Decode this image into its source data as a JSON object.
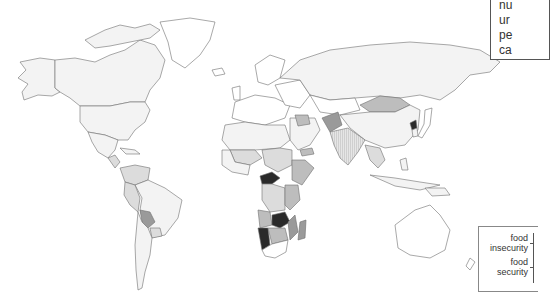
{
  "title_box": {
    "lines": [
      "nu",
      "ur",
      "pe",
      "ca"
    ]
  },
  "legend": {
    "top_label": [
      "food",
      "insecurity"
    ],
    "bottom_label": [
      "food",
      "security"
    ]
  },
  "map": {
    "type": "choropleth world map",
    "palette": [
      "#ffffff",
      "#f3f3f3",
      "#dcdcdc",
      "#bdbdbd",
      "#9a9a9a",
      "#2a2a2a"
    ],
    "darkest_regions": [
      "Central African Republic",
      "Zambia",
      "Namibia",
      "North Korea"
    ]
  }
}
